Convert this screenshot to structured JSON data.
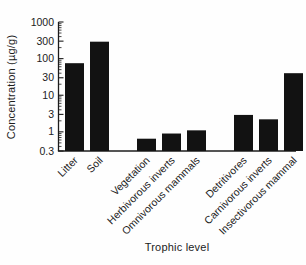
{
  "chart_data": {
    "type": "bar",
    "title": "",
    "xlabel": "Trophic level",
    "ylabel": "Concentration (µg/g)",
    "yscale": "log",
    "ylim": [
      0.3,
      1000
    ],
    "grid": false,
    "legend": null,
    "yticks": {
      "values": [
        1000,
        300,
        100,
        30,
        10,
        3,
        1,
        0.3
      ],
      "labels": [
        "1000",
        "300",
        "100",
        "30",
        "10",
        "3",
        "1",
        "0.3"
      ]
    },
    "categories": [
      "Litter",
      "Soil",
      "Vegetation",
      "Herbivorous inverts",
      "Omnivorous mammals",
      "Detritivores",
      "Carnivorous inverts",
      "Insectivorous mammal"
    ],
    "values": [
      75,
      290,
      0.65,
      0.9,
      1.1,
      2.9,
      2.2,
      40
    ],
    "group_breaks": [
      2,
      5
    ],
    "bar_color": "#121212",
    "axis_color": "#1c1c1c",
    "text_color": "#1c1c1c"
  }
}
